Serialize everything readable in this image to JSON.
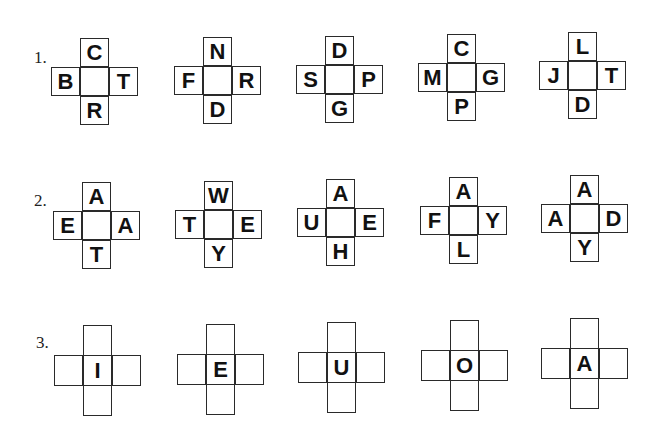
{
  "rows": [
    {
      "label": "1.",
      "puzzles": [
        {
          "top": "C",
          "left": "B",
          "center": "",
          "right": "T",
          "bottom": "R"
        },
        {
          "top": "N",
          "left": "F",
          "center": "",
          "right": "R",
          "bottom": "D"
        },
        {
          "top": "D",
          "left": "S",
          "center": "",
          "right": "P",
          "bottom": "G"
        },
        {
          "top": "C",
          "left": "M",
          "center": "",
          "right": "G",
          "bottom": "P"
        },
        {
          "top": "L",
          "left": "J",
          "center": "",
          "right": "T",
          "bottom": "D"
        }
      ]
    },
    {
      "label": "2.",
      "puzzles": [
        {
          "top": "A",
          "left": "E",
          "center": "",
          "right": "A",
          "bottom": "T"
        },
        {
          "top": "W",
          "left": "T",
          "center": "",
          "right": "E",
          "bottom": "Y"
        },
        {
          "top": "A",
          "left": "U",
          "center": "",
          "right": "E",
          "bottom": "H"
        },
        {
          "top": "A",
          "left": "F",
          "center": "",
          "right": "Y",
          "bottom": "L"
        },
        {
          "top": "A",
          "left": "A",
          "center": "",
          "right": "D",
          "bottom": "Y"
        }
      ]
    },
    {
      "label": "3.",
      "puzzles": [
        {
          "top": "",
          "left": "",
          "center": "I",
          "right": "",
          "bottom": ""
        },
        {
          "top": "",
          "left": "",
          "center": "E",
          "right": "",
          "bottom": ""
        },
        {
          "top": "",
          "left": "",
          "center": "U",
          "right": "",
          "bottom": ""
        },
        {
          "top": "",
          "left": "",
          "center": "O",
          "right": "",
          "bottom": ""
        },
        {
          "top": "",
          "left": "",
          "center": "A",
          "right": "",
          "bottom": ""
        }
      ]
    }
  ]
}
